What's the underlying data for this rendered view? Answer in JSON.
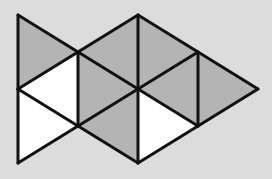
{
  "diagram": {
    "type": "triangle-tessellation",
    "colors": {
      "background": "#dcdcdc",
      "shaded": "#b4b4b4",
      "unshaded": "#ffffff",
      "stroke": "#111111"
    },
    "stroke_width": 3,
    "vertices": {
      "A": [
        18,
        15
      ],
      "B": [
        138,
        15
      ],
      "C": [
        78,
        52
      ],
      "D": [
        198,
        52
      ],
      "E": [
        18,
        89
      ],
      "F": [
        138,
        89
      ],
      "G": [
        258,
        89
      ],
      "H": [
        78,
        126
      ],
      "I": [
        198,
        126
      ],
      "J": [
        18,
        163
      ],
      "K": [
        138,
        163
      ]
    },
    "triangles": [
      {
        "id": "t1",
        "points": [
          "A",
          "C",
          "E"
        ],
        "fill": "shaded"
      },
      {
        "id": "t2",
        "points": [
          "E",
          "C",
          "H"
        ],
        "fill": "unshaded"
      },
      {
        "id": "t3",
        "points": [
          "E",
          "H",
          "J"
        ],
        "fill": "unshaded"
      },
      {
        "id": "t4",
        "points": [
          "C",
          "B",
          "F"
        ],
        "fill": "shaded"
      },
      {
        "id": "t5",
        "points": [
          "C",
          "F",
          "H"
        ],
        "fill": "shaded"
      },
      {
        "id": "t6",
        "points": [
          "H",
          "F",
          "K"
        ],
        "fill": "shaded"
      },
      {
        "id": "t7",
        "points": [
          "B",
          "D",
          "F"
        ],
        "fill": "shaded"
      },
      {
        "id": "t8",
        "points": [
          "F",
          "D",
          "I"
        ],
        "fill": "shaded"
      },
      {
        "id": "t9",
        "points": [
          "F",
          "I",
          "K"
        ],
        "fill": "unshaded"
      },
      {
        "id": "t10",
        "points": [
          "D",
          "G",
          "I"
        ],
        "fill": "shaded"
      }
    ],
    "counts": {
      "total_triangles": 10,
      "shaded": 7,
      "unshaded": 3
    }
  }
}
